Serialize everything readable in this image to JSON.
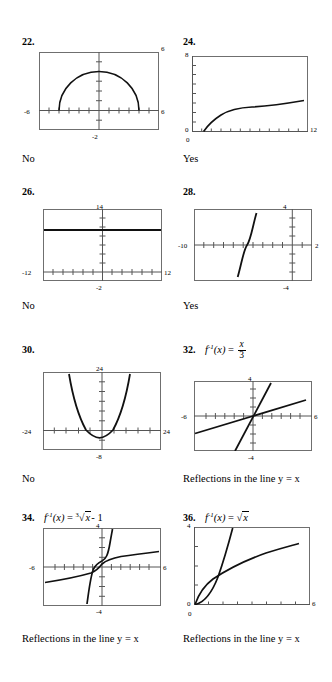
{
  "page": {
    "width": 332,
    "height": 682,
    "background": "#ffffff",
    "ink": "#000000",
    "frame_color": "#6f6f6f",
    "axis_color": "#555555",
    "curve_color": "#111111"
  },
  "problems": [
    {
      "number": "22.",
      "expression": null,
      "answer": "No",
      "graph": {
        "type": "line",
        "title": "22",
        "description": "Upper semicircle of radius 4 centered at origin",
        "xlim": [
          -6,
          6
        ],
        "ylim": [
          -2,
          6
        ],
        "x_axis_labels": {
          "left": "-6",
          "right": "6"
        },
        "y_axis_labels": {
          "top": "6",
          "bottom": "-2"
        },
        "x_tick_step": 1,
        "y_tick_step": 1,
        "axis_x_at_y": 0,
        "axis_y_at_x": 0,
        "grid": false,
        "series": [
          {
            "name": "y = sqrt(16 - x^2)",
            "x": [
              -4,
              -3.8,
              -3.5,
              -3,
              -2.5,
              -2,
              -1.5,
              -1,
              -0.5,
              0,
              0.5,
              1,
              1.5,
              2,
              2.5,
              3,
              3.5,
              3.8,
              4
            ],
            "y": [
              0,
              1.249,
              1.936,
              2.646,
              3.122,
              3.464,
              3.708,
              3.873,
              3.969,
              4,
              3.969,
              3.873,
              3.708,
              3.464,
              3.122,
              2.646,
              1.936,
              1.249,
              0
            ]
          }
        ]
      }
    },
    {
      "number": "24.",
      "expression": null,
      "answer": "Yes",
      "graph": {
        "type": "line",
        "title": "24",
        "description": "Square root curve starting near x = 1.2",
        "xlim": [
          0,
          12
        ],
        "ylim": [
          0,
          8
        ],
        "x_axis_labels": {
          "left": "0",
          "right": "12"
        },
        "y_axis_labels": {
          "top": "8",
          "bottom": "0"
        },
        "x_tick_step": 1,
        "y_tick_step": 1,
        "axis_x_at_y": 0,
        "axis_y_at_x": 0,
        "grid": false,
        "series": [
          {
            "name": "y = sqrt(x - 1.2)",
            "x": [
              1.2,
              1.5,
              2,
              2.5,
              3,
              4,
              5,
              6,
              7,
              8,
              9,
              10,
              11,
              11.6
            ],
            "y": [
              0,
              0.55,
              0.89,
              1.14,
              1.34,
              1.67,
              1.95,
              2.19,
              2.41,
              2.61,
              2.79,
              2.97,
              3.13,
              3.22
            ]
          }
        ]
      }
    },
    {
      "number": "26.",
      "expression": null,
      "answer": "No",
      "graph": {
        "type": "line",
        "title": "26",
        "description": "Horizontal constant line at about y = 11",
        "xlim": [
          -12,
          12
        ],
        "ylim": [
          -2,
          14
        ],
        "x_axis_labels": {
          "left": "-12",
          "right": "12"
        },
        "y_axis_labels": {
          "top": "14",
          "bottom": "-2"
        },
        "x_tick_step": 2,
        "y_tick_step": 2,
        "axis_x_at_y": 0,
        "axis_y_at_x": 0,
        "grid": false,
        "series": [
          {
            "name": "y = 11",
            "x": [
              -12,
              12
            ],
            "y": [
              11,
              11
            ]
          }
        ]
      }
    },
    {
      "number": "28.",
      "expression": null,
      "answer": "Yes",
      "graph": {
        "type": "line",
        "title": "28",
        "description": "Cubic curve with inflection near x = -4.6",
        "xlim": [
          -10,
          2
        ],
        "ylim": [
          -4,
          4
        ],
        "x_axis_labels": {
          "left": "-10",
          "right": "2"
        },
        "y_axis_labels": {
          "top": "4",
          "bottom": "-4"
        },
        "x_tick_step": 1,
        "y_tick_step": 1,
        "axis_x_at_y": 0,
        "axis_y_at_x": 0,
        "grid": false,
        "series": [
          {
            "name": "y = 5(x + 4.6)^3",
            "x": [
              -5.55,
              -5.4,
              -5.2,
              -5.0,
              -4.9,
              -4.8,
              -4.7,
              -4.6,
              -4.5,
              -4.4,
              -4.3,
              -4.2,
              -4.0,
              -3.8,
              -3.65
            ],
            "y": [
              -4.3,
              -2.6,
              -1.35,
              -0.6,
              -0.37,
              -0.16,
              -0.05,
              0,
              0.05,
              0.16,
              0.37,
              0.6,
              1.35,
              2.6,
              4.3
            ]
          }
        ]
      }
    },
    {
      "number": "30.",
      "expression": null,
      "answer": "No",
      "graph": {
        "type": "line",
        "title": "30",
        "description": "Upward parabola with vertex near (-1, -3)",
        "xlim": [
          -24,
          24
        ],
        "ylim": [
          -8,
          24
        ],
        "x_axis_labels": {
          "left": "-24",
          "right": "24"
        },
        "y_axis_labels": {
          "top": "24",
          "bottom": "-8"
        },
        "x_tick_step": 3,
        "y_tick_step": 4,
        "axis_x_at_y": 0,
        "axis_y_at_x": 0,
        "grid": false,
        "series": [
          {
            "name": "y = 0.22(x + 1)^2 - 3",
            "x": [
              -12,
              -10,
              -8,
              -6,
              -4,
              -2,
              -1,
              0,
              2,
              4,
              6,
              8,
              10,
              12
            ],
            "y": [
              23.6,
              14.8,
              7.8,
              2.5,
              -1.0,
              -2.8,
              -3.0,
              -2.8,
              -1.0,
              2.5,
              7.8,
              14.8,
              23.6,
              34.2
            ]
          }
        ]
      }
    },
    {
      "number": "32.",
      "expression": "f^{-1}(x) = x/3",
      "expression_parts": {
        "fn": "f",
        "inv": "-1",
        "arg": "(x)",
        "eq": "=",
        "num": "x",
        "den": "3"
      },
      "answer": "Reflections in the line y = x",
      "graph": {
        "type": "line",
        "title": "32",
        "description": "Line y = 3x and its inverse y = x/3",
        "xlim": [
          -6,
          6
        ],
        "ylim": [
          -4,
          4
        ],
        "x_axis_labels": {
          "left": "-6",
          "right": "6"
        },
        "y_axis_labels": {
          "top": "4",
          "bottom": "-4"
        },
        "x_tick_step": 0.6,
        "y_tick_step": 0.8,
        "axis_x_at_y": 0,
        "axis_y_at_x": 0,
        "grid": false,
        "series": [
          {
            "name": "y = 3x",
            "x": [
              -1.75,
              1.75
            ],
            "y": [
              -5.25,
              5.25
            ]
          },
          {
            "name": "y = x/3",
            "x": [
              -6,
              6
            ],
            "y": [
              -2,
              2
            ]
          }
        ]
      }
    },
    {
      "number": "34.",
      "expression": "f^{-1}(x) = cbrt(x) - 1",
      "expression_parts": {
        "fn": "f",
        "inv": "-1",
        "arg": "(x)",
        "eq": "=",
        "index": "3",
        "radicand": "x",
        "tail": "- 1"
      },
      "answer": "Reflections in the line y = x",
      "graph": {
        "type": "line",
        "title": "34",
        "description": "Cube-root curve and its steep inverse cubic, reflections in y = x",
        "xlim": [
          -6,
          6
        ],
        "ylim": [
          -4,
          4
        ],
        "x_axis_labels": {
          "left": "-6",
          "right": "6"
        },
        "y_axis_labels": {
          "top": "4",
          "bottom": "-4"
        },
        "x_tick_step": 0.6,
        "y_tick_step": 0.8,
        "axis_x_at_y": 0,
        "axis_y_at_x": 0,
        "grid": false,
        "series": [
          {
            "name": "y = cbrt(x) - 1 (shallow)",
            "x": [
              -6,
              -5,
              -4,
              -3,
              -2,
              -1,
              -0.4,
              0,
              0.4,
              1,
              2,
              3,
              4,
              5,
              6
            ],
            "y": [
              -1.6,
              -1.52,
              -1.42,
              -1.3,
              -1.12,
              -0.84,
              -0.52,
              -0.3,
              -0.08,
              0.2,
              0.5,
              0.7,
              0.86,
              0.98,
              1.1
            ]
          },
          {
            "name": "y = (x + 1)^3 (steep)",
            "x": [
              -1.55,
              -1.5,
              -1.4,
              -1.25,
              -1.1,
              -1.0,
              -0.9,
              -0.75,
              -0.6,
              -0.5,
              -0.45
            ],
            "y": [
              -4.0,
              -3.2,
              -2.0,
              -1.0,
              -0.35,
              0,
              0.35,
              1.0,
              2.0,
              3.2,
              4.0
            ]
          }
        ]
      }
    },
    {
      "number": "36.",
      "expression": "f^{-1}(x) = sqrt(x)",
      "expression_parts": {
        "fn": "f",
        "inv": "-1",
        "arg": "(x)",
        "eq": "=",
        "radicand": "x"
      },
      "answer": "Reflections in the line y = x",
      "graph": {
        "type": "line",
        "title": "36",
        "description": "Parabola y = x^2 and square-root curve y = sqrt(x), reflections in y = x",
        "xlim": [
          0,
          6
        ],
        "ylim": [
          0,
          4
        ],
        "x_axis_labels": {
          "left": "0",
          "right": "6"
        },
        "y_axis_labels": {
          "top": "4",
          "bottom": "0"
        },
        "x_tick_step": 0.75,
        "y_tick_step": 1,
        "axis_x_at_y": 0,
        "axis_y_at_x": 0,
        "grid": false,
        "series": [
          {
            "name": "y = x^2",
            "x": [
              0,
              0.25,
              0.5,
              0.75,
              1,
              1.25,
              1.5,
              1.75,
              1.9,
              2.0
            ],
            "y": [
              0,
              0.06,
              0.25,
              0.56,
              1.0,
              1.56,
              2.25,
              3.06,
              3.6,
              4.0
            ]
          },
          {
            "name": "y = sqrt(x)",
            "x": [
              0,
              0.1,
              0.25,
              0.5,
              0.75,
              1,
              1.5,
              2,
              2.5,
              3,
              3.5,
              4,
              4.5,
              5,
              5.5
            ],
            "y": [
              0,
              0.32,
              0.5,
              0.71,
              0.87,
              1.0,
              1.22,
              1.41,
              1.58,
              1.73,
              1.87,
              2.0,
              2.12,
              2.24,
              2.35
            ]
          }
        ]
      }
    }
  ]
}
